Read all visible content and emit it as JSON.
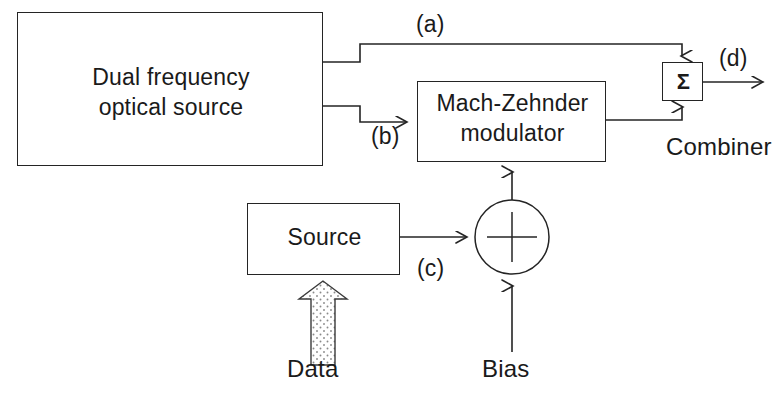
{
  "diagram": {
    "stroke_color": "#242424",
    "text_color": "#1a1a1a",
    "fill_color": "#ffffff",
    "stipple_color": "#7a7a7a"
  },
  "blocks": {
    "optical_source": {
      "line1": "Dual frequency",
      "line2": "optical source",
      "x": 17,
      "y": 12,
      "w": 306,
      "h": 154
    },
    "modulator": {
      "line1": "Mach-Zehnder",
      "line2": "modulator",
      "x": 417,
      "y": 81,
      "w": 189,
      "h": 81
    },
    "source": {
      "label": "Source",
      "x": 247,
      "y": 203,
      "w": 153,
      "h": 72
    },
    "combiner": {
      "symbol": "Σ",
      "caption": "Combiner",
      "x": 662,
      "y": 62,
      "w": 41,
      "h": 39
    },
    "adder": {
      "symbol": "+",
      "cx": 512,
      "cy": 237,
      "r": 37
    }
  },
  "signal_tags": {
    "a": "(a)",
    "b": "(b)",
    "c": "(c)",
    "d": "(d)"
  },
  "inputs": {
    "data": "Data",
    "bias": "Bias"
  },
  "icons": {
    "arrowhead": "arrowhead-icon",
    "block_arrow": "data-block-arrow-icon",
    "sigma": "sigma-icon",
    "plus_circle": "plus-circle-icon"
  }
}
